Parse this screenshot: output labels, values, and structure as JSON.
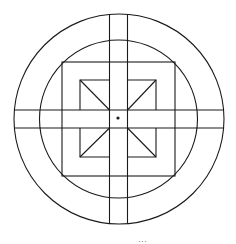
{
  "diagram": {
    "type": "geometric-figure",
    "stroke_color": "#1a1a1a",
    "background": "#ffffff",
    "center": [
      118,
      119
    ],
    "outer_circle": {
      "cx": 119,
      "cy": 119,
      "r": 105
    },
    "inner_circle": {
      "cx": 118.5,
      "cy": 119,
      "r": 79
    },
    "vertical_band": {
      "x1": 109,
      "x2": 127
    },
    "horizontal_band": {
      "y1": 110,
      "y2": 128
    },
    "outer_square": {
      "x": 62,
      "y": 62,
      "w": 113,
      "h": 114
    },
    "inner_square": {
      "x": 80,
      "y": 80,
      "w": 76,
      "h": 77
    },
    "center_dot": {
      "cx": 118,
      "cy": 118,
      "r": 1.6
    }
  },
  "caption": "···"
}
